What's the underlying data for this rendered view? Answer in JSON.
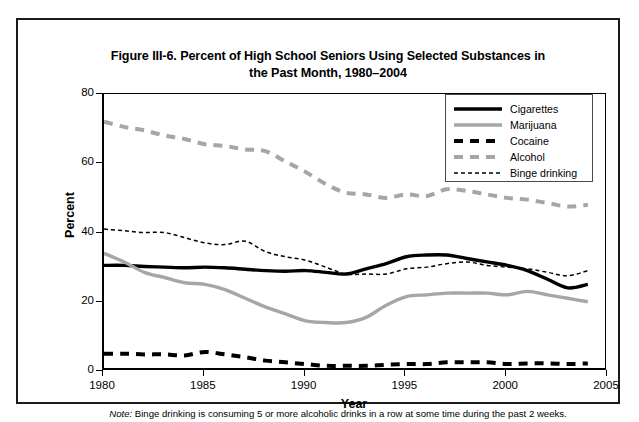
{
  "figure": {
    "title": "Figure III-6. Percent of High School Seniors Using Selected Substances in the Past Month, 1980–2004",
    "title_line1": "Figure III-6. Percent of High School Seniors Using Selected Substances in",
    "title_line2": "the Past Month, 1980–2004",
    "note_lead": "Note:",
    "note_text": "Binge drinking is consuming 5 or more alcoholic drinks in a row at some time during the past 2 weeks."
  },
  "chart_data": {
    "type": "line",
    "title": "Figure III-6. Percent of High School Seniors Using Selected Substances in the Past Month, 1980–2004",
    "xlabel": "Year",
    "ylabel": "Percent",
    "xlim": [
      1980,
      2005
    ],
    "ylim": [
      0,
      80
    ],
    "xticks": [
      1980,
      1985,
      1990,
      1995,
      2000,
      2005
    ],
    "yticks": [
      0,
      20,
      40,
      60,
      80
    ],
    "grid": false,
    "legend_position": "top-right",
    "x": [
      1980,
      1981,
      1982,
      1983,
      1984,
      1985,
      1986,
      1987,
      1988,
      1989,
      1990,
      1991,
      1992,
      1993,
      1994,
      1995,
      1996,
      1997,
      1998,
      1999,
      2000,
      2001,
      2002,
      2003,
      2004
    ],
    "series": [
      {
        "name": "Cigarettes",
        "color": "#000000",
        "style": "solid-thick",
        "values": [
          30.5,
          30.5,
          30.2,
          30.0,
          29.8,
          30.0,
          29.8,
          29.4,
          29.0,
          28.8,
          29.0,
          28.5,
          28.0,
          29.5,
          31.0,
          33.0,
          33.5,
          33.5,
          32.5,
          31.5,
          30.5,
          29.0,
          26.5,
          24.0,
          25.0
        ]
      },
      {
        "name": "Marijuana",
        "color": "#a6a6a6",
        "style": "solid-thick",
        "values": [
          34.0,
          31.5,
          28.5,
          27.0,
          25.5,
          25.0,
          23.5,
          21.0,
          18.5,
          16.5,
          14.5,
          14.0,
          14.0,
          15.5,
          19.0,
          21.5,
          22.0,
          22.5,
          22.5,
          22.5,
          22.0,
          23.0,
          22.0,
          21.0,
          20.0
        ]
      },
      {
        "name": "Cocaine",
        "color": "#000000",
        "style": "dashed-thick",
        "values": [
          5.0,
          5.0,
          4.8,
          4.8,
          4.5,
          5.5,
          4.8,
          4.0,
          3.0,
          2.5,
          2.0,
          1.5,
          1.5,
          1.5,
          1.8,
          2.0,
          2.0,
          2.5,
          2.5,
          2.5,
          2.0,
          2.2,
          2.2,
          2.0,
          2.2
        ]
      },
      {
        "name": "Alcohol",
        "color": "#a6a6a6",
        "style": "dashed-thick",
        "values": [
          72.0,
          70.5,
          69.5,
          68.0,
          67.0,
          65.5,
          65.0,
          64.0,
          63.5,
          60.5,
          57.5,
          54.0,
          51.5,
          51.0,
          50.0,
          51.0,
          50.5,
          52.5,
          52.0,
          51.0,
          50.0,
          49.5,
          48.5,
          47.5,
          48.0
        ]
      },
      {
        "name": "Binge drinking",
        "color": "#000000",
        "style": "dotted-thin",
        "values": [
          41.0,
          40.5,
          40.0,
          40.0,
          38.5,
          37.0,
          36.5,
          37.5,
          34.5,
          33.0,
          32.0,
          30.0,
          28.0,
          28.0,
          28.0,
          29.5,
          30.0,
          31.0,
          31.5,
          30.5,
          30.0,
          29.5,
          28.5,
          27.5,
          29.0
        ]
      }
    ]
  },
  "legend": {
    "items": [
      {
        "label": "Cigarettes"
      },
      {
        "label": "Marijuana"
      },
      {
        "label": "Cocaine"
      },
      {
        "label": "Alcohol"
      },
      {
        "label": "Binge drinking"
      }
    ]
  },
  "axes": {
    "y_labels": [
      "80",
      "60",
      "40",
      "20",
      "0"
    ],
    "x_labels": [
      "1980",
      "1985",
      "1990",
      "1995",
      "2000",
      "2005"
    ],
    "y_title": "Percent",
    "x_title": "Year"
  }
}
